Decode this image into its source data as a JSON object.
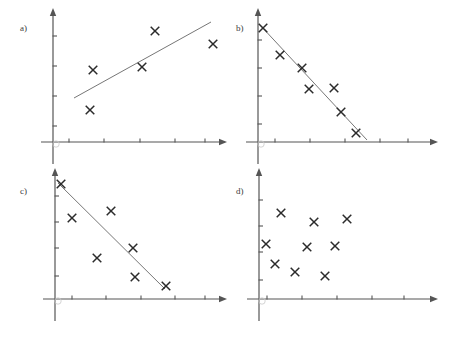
{
  "figure": {
    "width": 449,
    "height": 340,
    "background": "#ffffff",
    "marker_glyph": "x-cross-marker",
    "marker_color": "#2b2b2b",
    "axis_color": "#555555",
    "fit_line_color": "#666666",
    "panel_count": 4
  },
  "panels": [
    {
      "id": "a",
      "label": "a)",
      "label_x": 20,
      "label_y": 24,
      "origin_x": 53,
      "origin_y": 142,
      "x_axis_end": 219,
      "y_axis_top": 16,
      "x_ticks": [
        69,
        104,
        140,
        175,
        205
      ],
      "y_ticks": [
        36,
        66,
        96,
        126
      ],
      "fit_line": {
        "x1": 74,
        "y1": 98,
        "x2": 211,
        "y2": 22
      },
      "has_fit_line": true,
      "points": [
        {
          "x": 155,
          "y": 31
        },
        {
          "x": 213,
          "y": 44
        },
        {
          "x": 93,
          "y": 70
        },
        {
          "x": 142,
          "y": 67
        },
        {
          "x": 90,
          "y": 110
        }
      ]
    },
    {
      "id": "b",
      "label": "b)",
      "label_x": 236,
      "label_y": 24,
      "origin_x": 258,
      "origin_y": 142,
      "x_axis_end": 430,
      "y_axis_top": 16,
      "x_ticks": [
        275,
        310,
        345,
        380,
        408
      ],
      "y_ticks": [
        40,
        68,
        96,
        124
      ],
      "fit_line": {
        "x1": 260,
        "y1": 25,
        "x2": 367,
        "y2": 140
      },
      "has_fit_line": true,
      "points": [
        {
          "x": 263,
          "y": 28
        },
        {
          "x": 280,
          "y": 55
        },
        {
          "x": 302,
          "y": 68
        },
        {
          "x": 309,
          "y": 89
        },
        {
          "x": 334,
          "y": 88
        },
        {
          "x": 341,
          "y": 112
        },
        {
          "x": 356,
          "y": 133
        }
      ]
    },
    {
      "id": "c",
      "label": "c)",
      "label_x": 20,
      "label_y": 187,
      "origin_x": 55,
      "origin_y": 299,
      "x_axis_end": 219,
      "y_axis_top": 176,
      "x_ticks": [
        72,
        106,
        141,
        175,
        205
      ],
      "y_ticks": [
        196,
        222,
        248,
        276
      ],
      "fit_line": {
        "x1": 58,
        "y1": 183,
        "x2": 165,
        "y2": 289
      },
      "has_fit_line": true,
      "points": [
        {
          "x": 61,
          "y": 184
        },
        {
          "x": 72,
          "y": 218
        },
        {
          "x": 111,
          "y": 211
        },
        {
          "x": 133,
          "y": 248
        },
        {
          "x": 97,
          "y": 258
        },
        {
          "x": 135,
          "y": 277
        },
        {
          "x": 166,
          "y": 286
        }
      ]
    },
    {
      "id": "d",
      "label": "d)",
      "label_x": 236,
      "label_y": 187,
      "origin_x": 259,
      "origin_y": 299,
      "x_axis_end": 430,
      "y_axis_top": 176,
      "x_ticks": [
        267,
        302,
        337,
        372,
        404
      ],
      "y_ticks": [
        200,
        226,
        252,
        280
      ],
      "fit_line": null,
      "has_fit_line": false,
      "points": [
        {
          "x": 281,
          "y": 213
        },
        {
          "x": 314,
          "y": 222
        },
        {
          "x": 347,
          "y": 219
        },
        {
          "x": 266,
          "y": 244
        },
        {
          "x": 307,
          "y": 247
        },
        {
          "x": 335,
          "y": 246
        },
        {
          "x": 275,
          "y": 264
        },
        {
          "x": 295,
          "y": 272
        },
        {
          "x": 325,
          "y": 276
        }
      ]
    }
  ]
}
